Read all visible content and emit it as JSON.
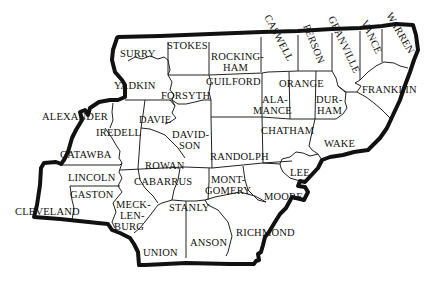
{
  "map": {
    "title": "North Carolina Piedmont Counties",
    "colors": {
      "background": "#ffffff",
      "outline": "#111111",
      "county_border": "#222222",
      "label": "#111111"
    },
    "counties": [
      {
        "id": "surry",
        "lines": [
          "SURRY"
        ]
      },
      {
        "id": "stokes",
        "lines": [
          "STOKES"
        ]
      },
      {
        "id": "rockingham",
        "lines": [
          "ROCKING-",
          "HAM"
        ]
      },
      {
        "id": "caswell",
        "lines": [
          "CASWELL"
        ]
      },
      {
        "id": "person",
        "lines": [
          "PERSON"
        ]
      },
      {
        "id": "granville",
        "lines": [
          "GRANVILLE"
        ]
      },
      {
        "id": "vance",
        "lines": [
          "VANCE"
        ]
      },
      {
        "id": "warren",
        "lines": [
          "WARREN"
        ]
      },
      {
        "id": "yadkin",
        "lines": [
          "YADKIN"
        ]
      },
      {
        "id": "forsyth",
        "lines": [
          "FORSYTH"
        ]
      },
      {
        "id": "guilford",
        "lines": [
          "GUILFORD"
        ]
      },
      {
        "id": "orange",
        "lines": [
          "ORANGE"
        ]
      },
      {
        "id": "alamance",
        "lines": [
          "ALA-",
          "MANCE"
        ]
      },
      {
        "id": "durham",
        "lines": [
          "DUR-",
          "HAM"
        ]
      },
      {
        "id": "franklin",
        "lines": [
          "FRANKLIN"
        ]
      },
      {
        "id": "alexander",
        "lines": [
          "ALEXANDER"
        ]
      },
      {
        "id": "davie",
        "lines": [
          "DAVIE"
        ]
      },
      {
        "id": "iredell",
        "lines": [
          "IREDELL"
        ]
      },
      {
        "id": "davidson",
        "lines": [
          "DAVID-",
          "SON"
        ]
      },
      {
        "id": "chatham",
        "lines": [
          "CHATHAM"
        ]
      },
      {
        "id": "wake",
        "lines": [
          "WAKE"
        ]
      },
      {
        "id": "catawba",
        "lines": [
          "CATAWBA"
        ]
      },
      {
        "id": "rowan",
        "lines": [
          "ROWAN"
        ]
      },
      {
        "id": "randolph",
        "lines": [
          "RANDOLPH"
        ]
      },
      {
        "id": "lincoln",
        "lines": [
          "LINCOLN"
        ]
      },
      {
        "id": "cabarrus",
        "lines": [
          "CABARRUS"
        ]
      },
      {
        "id": "montgomery",
        "lines": [
          "MONT-",
          "GOMERY"
        ]
      },
      {
        "id": "lee",
        "lines": [
          "LEE"
        ]
      },
      {
        "id": "gaston",
        "lines": [
          "GASTON"
        ]
      },
      {
        "id": "moore",
        "lines": [
          "MOORE"
        ]
      },
      {
        "id": "cleveland",
        "lines": [
          "CLEVELAND"
        ]
      },
      {
        "id": "mecklenburg",
        "lines": [
          "MECK-",
          "LEN-",
          "BURG"
        ]
      },
      {
        "id": "stanly",
        "lines": [
          "STANLY"
        ]
      },
      {
        "id": "anson",
        "lines": [
          "ANSON"
        ]
      },
      {
        "id": "richmond",
        "lines": [
          "RICHMOND"
        ]
      },
      {
        "id": "union",
        "lines": [
          "UNION"
        ]
      }
    ]
  }
}
